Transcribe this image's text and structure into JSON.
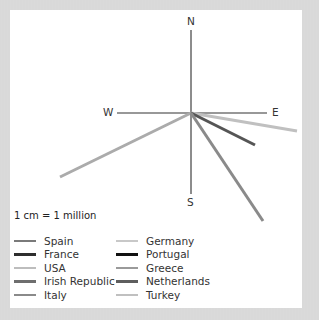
{
  "compass": {
    "north": "N",
    "south": "S",
    "east": "E",
    "west": "W"
  },
  "scale": "1 cm = 1 million",
  "legend": {
    "items": [
      {
        "label": "Spain",
        "color": "#7a7a7a"
      },
      {
        "label": "France",
        "color": "#2e2e2e"
      },
      {
        "label": "USA",
        "color": "#bdbdbd"
      },
      {
        "label": "Irish Republic",
        "color": "#6e6e6e"
      },
      {
        "label": "Italy",
        "color": "#8a8a8a"
      },
      {
        "label": "Germany",
        "color": "#c8c8c8"
      },
      {
        "label": "Portugal",
        "color": "#111111"
      },
      {
        "label": "Greece",
        "color": "#9a9a9a"
      },
      {
        "label": "Netherlands",
        "color": "#5e5e5e"
      },
      {
        "label": "Turkey",
        "color": "#c0c0c0"
      }
    ]
  },
  "vectors": [
    {
      "id": "wsw-light",
      "x2": 60,
      "y2": 177,
      "color": "#ababab"
    },
    {
      "id": "ese-light",
      "x2": 297,
      "y2": 131,
      "color": "#c0c0c0"
    },
    {
      "id": "se-dark",
      "x2": 255,
      "y2": 145,
      "color": "#555555"
    },
    {
      "id": "sse-medium",
      "x2": 263,
      "y2": 221,
      "color": "#8a8a8a"
    }
  ],
  "chart_data": {
    "type": "diagram",
    "title": "",
    "center": [
      191,
      113
    ],
    "axes": {
      "N": "N",
      "S": "S",
      "E": "E",
      "W": "W"
    },
    "scale": "1 cm = 1 million",
    "visible_vectors": [
      {
        "direction": "WSW",
        "approx_bearing_deg": 246,
        "relative_length_px": 146
      },
      {
        "direction": "ESE",
        "approx_bearing_deg": 100,
        "relative_length_px": 107
      },
      {
        "direction": "SE",
        "approx_bearing_deg": 117,
        "relative_length_px": 72
      },
      {
        "direction": "SSE",
        "approx_bearing_deg": 146,
        "relative_length_px": 130
      }
    ],
    "legend": [
      "Spain",
      "France",
      "USA",
      "Irish Republic",
      "Italy",
      "Germany",
      "Portugal",
      "Greece",
      "Netherlands",
      "Turkey"
    ]
  }
}
